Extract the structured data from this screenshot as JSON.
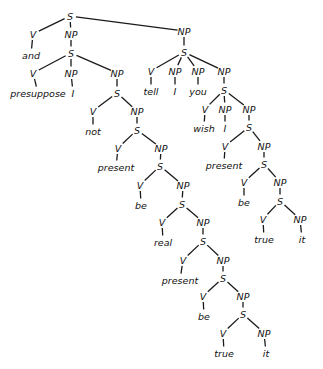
{
  "diagram": {
    "type": "syntax-tree",
    "colors": {
      "line": "#1a1a1a",
      "text": "#111111",
      "background": "#ffffff"
    },
    "nodes": [
      {
        "id": "n0",
        "label": "S",
        "x": 70,
        "y": 16,
        "parent": null
      },
      {
        "id": "n1",
        "label": "V",
        "x": 33,
        "y": 34,
        "parent": "n0"
      },
      {
        "id": "n2",
        "label": "and",
        "x": 31,
        "y": 55,
        "parent": "n1"
      },
      {
        "id": "n3",
        "label": "NP",
        "x": 71,
        "y": 34,
        "parent": "n0"
      },
      {
        "id": "n4",
        "label": "NP",
        "x": 184,
        "y": 31,
        "parent": "n0"
      },
      {
        "id": "n5",
        "label": "S",
        "x": 71,
        "y": 53,
        "parent": "n3"
      },
      {
        "id": "n6",
        "label": "V",
        "x": 33,
        "y": 73,
        "parent": "n5"
      },
      {
        "id": "n7",
        "label": "presuppose",
        "x": 38,
        "y": 93,
        "parent": "n6"
      },
      {
        "id": "n8",
        "label": "NP",
        "x": 71,
        "y": 73,
        "parent": "n5"
      },
      {
        "id": "n9",
        "label": "I",
        "x": 73,
        "y": 93,
        "parent": "n8"
      },
      {
        "id": "n10",
        "label": "NP",
        "x": 117,
        "y": 73,
        "parent": "n5"
      },
      {
        "id": "n11",
        "label": "S",
        "x": 117,
        "y": 93,
        "parent": "n10"
      },
      {
        "id": "n12",
        "label": "V",
        "x": 93,
        "y": 111,
        "parent": "n11"
      },
      {
        "id": "n13",
        "label": "not",
        "x": 93,
        "y": 131,
        "parent": "n12"
      },
      {
        "id": "n14",
        "label": "NP",
        "x": 137,
        "y": 111,
        "parent": "n11"
      },
      {
        "id": "n15",
        "label": "S",
        "x": 137,
        "y": 130,
        "parent": "n14"
      },
      {
        "id": "n16",
        "label": "V",
        "x": 118,
        "y": 148,
        "parent": "n15"
      },
      {
        "id": "n17",
        "label": "present",
        "x": 116,
        "y": 167,
        "parent": "n16"
      },
      {
        "id": "n18",
        "label": "NP",
        "x": 161,
        "y": 148,
        "parent": "n15"
      },
      {
        "id": "n19",
        "label": "S",
        "x": 160,
        "y": 166,
        "parent": "n18"
      },
      {
        "id": "n20",
        "label": "V",
        "x": 140,
        "y": 185,
        "parent": "n19"
      },
      {
        "id": "n21",
        "label": "be",
        "x": 141,
        "y": 205,
        "parent": "n20"
      },
      {
        "id": "n22",
        "label": "NP",
        "x": 183,
        "y": 185,
        "parent": "n19"
      },
      {
        "id": "n23",
        "label": "S",
        "x": 182,
        "y": 204,
        "parent": "n22"
      },
      {
        "id": "n24",
        "label": "V",
        "x": 162,
        "y": 222,
        "parent": "n23"
      },
      {
        "id": "n25",
        "label": "real",
        "x": 163,
        "y": 242,
        "parent": "n24"
      },
      {
        "id": "n26",
        "label": "NP",
        "x": 203,
        "y": 222,
        "parent": "n23"
      },
      {
        "id": "n27",
        "label": "S",
        "x": 203,
        "y": 241,
        "parent": "n26"
      },
      {
        "id": "n28",
        "label": "V",
        "x": 183,
        "y": 260,
        "parent": "n27"
      },
      {
        "id": "n29",
        "label": "present",
        "x": 180,
        "y": 280,
        "parent": "n28"
      },
      {
        "id": "n30",
        "label": "NP",
        "x": 223,
        "y": 260,
        "parent": "n27"
      },
      {
        "id": "n31",
        "label": "S",
        "x": 223,
        "y": 278,
        "parent": "n30"
      },
      {
        "id": "n32",
        "label": "V",
        "x": 203,
        "y": 296,
        "parent": "n31"
      },
      {
        "id": "n33",
        "label": "be",
        "x": 204,
        "y": 316,
        "parent": "n32"
      },
      {
        "id": "n34",
        "label": "NP",
        "x": 243,
        "y": 296,
        "parent": "n31"
      },
      {
        "id": "n35",
        "label": "S",
        "x": 243,
        "y": 314,
        "parent": "n34"
      },
      {
        "id": "n36",
        "label": "V",
        "x": 223,
        "y": 333,
        "parent": "n35"
      },
      {
        "id": "n37",
        "label": "true",
        "x": 224,
        "y": 353,
        "parent": "n36"
      },
      {
        "id": "n38",
        "label": "NP",
        "x": 264,
        "y": 333,
        "parent": "n35"
      },
      {
        "id": "n39",
        "label": "it",
        "x": 266,
        "y": 353,
        "parent": "n38"
      },
      {
        "id": "n40",
        "label": "S",
        "x": 184,
        "y": 52,
        "parent": "n4"
      },
      {
        "id": "n41",
        "label": "V",
        "x": 151,
        "y": 71,
        "parent": "n40"
      },
      {
        "id": "n42",
        "label": "tell",
        "x": 151,
        "y": 91,
        "parent": "n41"
      },
      {
        "id": "n43",
        "label": "NP",
        "x": 175,
        "y": 71,
        "parent": "n40"
      },
      {
        "id": "n44",
        "label": "I",
        "x": 175,
        "y": 91,
        "parent": "n43"
      },
      {
        "id": "n45",
        "label": "NP",
        "x": 198,
        "y": 71,
        "parent": "n40"
      },
      {
        "id": "n46",
        "label": "you",
        "x": 198,
        "y": 91,
        "parent": "n45"
      },
      {
        "id": "n47",
        "label": "NP",
        "x": 224,
        "y": 71,
        "parent": "n40"
      },
      {
        "id": "n48",
        "label": "S",
        "x": 224,
        "y": 90,
        "parent": "n47"
      },
      {
        "id": "n49",
        "label": "V",
        "x": 205,
        "y": 109,
        "parent": "n48"
      },
      {
        "id": "n50",
        "label": "wish",
        "x": 204,
        "y": 128,
        "parent": "n49"
      },
      {
        "id": "n51",
        "label": "NP",
        "x": 225,
        "y": 109,
        "parent": "n48"
      },
      {
        "id": "n52",
        "label": "I",
        "x": 225,
        "y": 128,
        "parent": "n51"
      },
      {
        "id": "n53",
        "label": "NP",
        "x": 249,
        "y": 109,
        "parent": "n48"
      },
      {
        "id": "n54",
        "label": "S",
        "x": 249,
        "y": 127,
        "parent": "n53"
      },
      {
        "id": "n55",
        "label": "V",
        "x": 225,
        "y": 146,
        "parent": "n54"
      },
      {
        "id": "n56",
        "label": "present",
        "x": 224,
        "y": 165,
        "parent": "n55"
      },
      {
        "id": "n57",
        "label": "NP",
        "x": 264,
        "y": 146,
        "parent": "n54"
      },
      {
        "id": "n58",
        "label": "S",
        "x": 264,
        "y": 164,
        "parent": "n57"
      },
      {
        "id": "n59",
        "label": "V",
        "x": 244,
        "y": 182,
        "parent": "n58"
      },
      {
        "id": "n60",
        "label": "be",
        "x": 244,
        "y": 202,
        "parent": "n59"
      },
      {
        "id": "n61",
        "label": "NP",
        "x": 280,
        "y": 182,
        "parent": "n58"
      },
      {
        "id": "n62",
        "label": "S",
        "x": 280,
        "y": 201,
        "parent": "n61"
      },
      {
        "id": "n63",
        "label": "V",
        "x": 263,
        "y": 219,
        "parent": "n62"
      },
      {
        "id": "n64",
        "label": "true",
        "x": 264,
        "y": 239,
        "parent": "n63"
      },
      {
        "id": "n65",
        "label": "NP",
        "x": 300,
        "y": 219,
        "parent": "n62"
      },
      {
        "id": "n66",
        "label": "it",
        "x": 302,
        "y": 239,
        "parent": "n65"
      }
    ]
  }
}
